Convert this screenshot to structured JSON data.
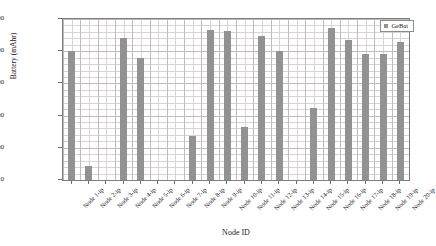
{
  "chart_data": {
    "type": "bar",
    "title": "",
    "xlabel": "Node ID",
    "ylabel": "Battery (mAhr)",
    "ylim": [
      0,
      2500
    ],
    "yticks": [
      0,
      500,
      1000,
      1500,
      2000,
      2500
    ],
    "ytick_labels": [
      "0",
      "500",
      "1000",
      "1500",
      "2000",
      "2500"
    ],
    "grid": true,
    "legend_position": "top-right",
    "legend": [
      "GeBat"
    ],
    "categories": [
      "Node 1-ip",
      "Node 2-ip",
      "Node 3-ip",
      "Node 4-ip",
      "Node 5-ip",
      "Node 6-ip",
      "Node 7-ip",
      "Node 8-ip",
      "Node 9-ip",
      "Node 10-ip",
      "Node 11-ip",
      "Node 12-ip",
      "Node 13-ip",
      "Node 14-ip",
      "Node 15-ip",
      "Node 16-ip",
      "Node 17-ip",
      "Node 18-ip",
      "Node 19-ip",
      "Node 20-ip"
    ],
    "series": [
      {
        "name": "GeBat",
        "color": "#929292",
        "values": [
          2000,
          220,
          0,
          2200,
          1900,
          0,
          0,
          680,
          2330,
          2320,
          820,
          2230,
          2010,
          0,
          1120,
          2360,
          2180,
          1960,
          1960,
          2150
        ]
      }
    ]
  }
}
